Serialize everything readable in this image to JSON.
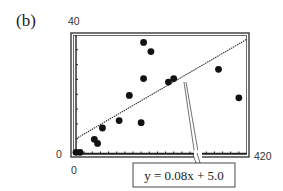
{
  "chart_data": {
    "type": "scatter",
    "panel_label": "(b)",
    "title": "",
    "xlabel": "",
    "ylabel": "",
    "xlim": [
      0,
      420
    ],
    "ylim": [
      0,
      40
    ],
    "x_tick_interval": 20,
    "y_tick_interval": 5,
    "axis_labels": {
      "x_min": "0",
      "x_max": "420",
      "y_min": "0",
      "y_max": "40"
    },
    "grid": false,
    "legend": null,
    "series": [
      {
        "name": "data points",
        "type": "scatter",
        "points": [
          {
            "x": 0,
            "y": 0.4
          },
          {
            "x": 10,
            "y": 0.4
          },
          {
            "x": 45,
            "y": 4.8
          },
          {
            "x": 53,
            "y": 3.4
          },
          {
            "x": 65,
            "y": 8.6
          },
          {
            "x": 106,
            "y": 11.1
          },
          {
            "x": 131,
            "y": 19.6
          },
          {
            "x": 160,
            "y": 10.4
          },
          {
            "x": 166,
            "y": 37.5
          },
          {
            "x": 184,
            "y": 34.4
          },
          {
            "x": 166,
            "y": 25.3
          },
          {
            "x": 227,
            "y": 24.1
          },
          {
            "x": 240,
            "y": 25.3
          },
          {
            "x": 350,
            "y": 28.4
          },
          {
            "x": 400,
            "y": 18.8
          }
        ]
      },
      {
        "name": "regression line",
        "type": "line",
        "slope": 0.08,
        "intercept": 5.0,
        "points": [
          {
            "x": 0,
            "y": 5.0
          },
          {
            "x": 420,
            "y": 38.6
          }
        ]
      }
    ],
    "annotations": [
      {
        "text": "y = 0.08x + 5.0",
        "points_to": {
          "x": 265,
          "y": 26.2
        }
      }
    ]
  },
  "colors": {
    "ink": "#1a1a1a",
    "frame": "#2a2a2a",
    "background": "#ffffff"
  }
}
